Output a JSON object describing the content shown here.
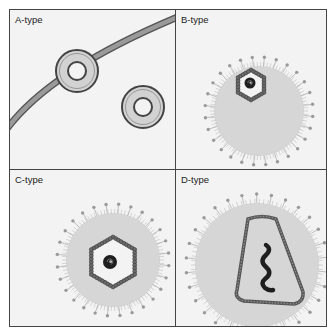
{
  "figure": {
    "panels": [
      {
        "id": "a",
        "label": "A-type",
        "description": "Two ring-shaped particles, one budding from a curved membrane"
      },
      {
        "id": "b",
        "label": "B-type",
        "description": "Spiked envelope with eccentric hexagonal core containing dense nucleoid"
      },
      {
        "id": "c",
        "label": "C-type",
        "description": "Spiked envelope with central hexagonal capsid containing dense nucleoid"
      },
      {
        "id": "d",
        "label": "D-type",
        "description": "Spiked envelope with cone-shaped capsid containing elongated nucleoid"
      }
    ],
    "colors": {
      "background": "#f3f3f3",
      "frame": "#444444",
      "membrane": "#8a8a8a",
      "envelope": "#d6d6d6",
      "spike": "#9a9a9a",
      "capsid": "#555555",
      "nucleoid": "#1e1e1e",
      "ring_fill": "#d2d2d2"
    }
  }
}
